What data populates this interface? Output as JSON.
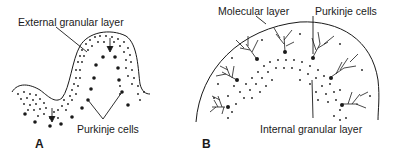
{
  "panel_a": {
    "letter": "A",
    "labels": {
      "external_granular_layer": "External granular layer",
      "purkinje_cells": "Purkinje cells"
    }
  },
  "panel_b": {
    "letter": "B",
    "labels": {
      "molecular_layer": "Molecular layer",
      "purkinje_cells": "Purkinje cells",
      "internal_granular_layer": "Internal granular layer"
    }
  },
  "colors": {
    "ink": "#1a1a1a",
    "background": "#ffffff"
  }
}
